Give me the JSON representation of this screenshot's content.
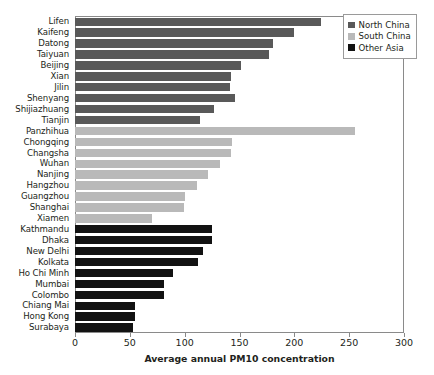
{
  "chart_data": {
    "type": "bar",
    "orientation": "horizontal",
    "title": "",
    "xlabel": "Average annual PM10 concentration",
    "ylabel": "",
    "xlim": [
      0,
      300
    ],
    "xticks": [
      0,
      50,
      100,
      150,
      200,
      250,
      300
    ],
    "grid": false,
    "legend_position": "top-right",
    "colors": {
      "north_china": "#595959",
      "south_china": "#b9b9b9",
      "other_asia": "#121212"
    },
    "legend": [
      {
        "label": "North China",
        "key": "north",
        "color": "#595959"
      },
      {
        "label": "South China",
        "key": "south",
        "color": "#b9b9b9"
      },
      {
        "label": "Other Asia",
        "key": "other",
        "color": "#121212"
      }
    ],
    "categories": [
      "Lifen",
      "Kaifeng",
      "Datong",
      "Taiyuan",
      "Beijing",
      "Xian",
      "Jilin",
      "Shenyang",
      "Shijiazhuang",
      "Tianjin",
      "Panzhihua",
      "Chongqing",
      "Changsha",
      "Wuhan",
      "Nanjing",
      "Hangzhou",
      "Guangzhou",
      "Shanghai",
      "Xiamen",
      "Kathmandu",
      "Dhaka",
      "New Delhi",
      "Kolkata",
      "Ho Chi Minh",
      "Mumbai",
      "Colombo",
      "Chiang Mai",
      "Hong Kong",
      "Surabaya"
    ],
    "values": [
      224,
      200,
      181,
      177,
      151,
      142,
      141,
      146,
      127,
      114,
      255,
      143,
      142,
      132,
      121,
      111,
      100,
      99,
      70,
      125,
      125,
      117,
      112,
      89,
      81,
      81,
      55,
      55,
      53
    ],
    "groups": [
      "north",
      "north",
      "north",
      "north",
      "north",
      "north",
      "north",
      "north",
      "north",
      "north",
      "south",
      "south",
      "south",
      "south",
      "south",
      "south",
      "south",
      "south",
      "south",
      "other",
      "other",
      "other",
      "other",
      "other",
      "other",
      "other",
      "other",
      "other",
      "other"
    ]
  }
}
